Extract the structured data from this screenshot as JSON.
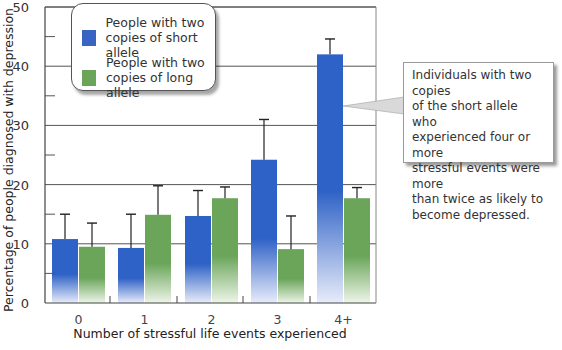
{
  "chart_data": {
    "type": "bar",
    "title": "",
    "xlabel": "Number of stressful life events experienced",
    "ylabel": "Percentage of people diagnosed with depression",
    "ylim": [
      0,
      50
    ],
    "yticks": [
      0,
      10,
      20,
      30,
      40,
      50
    ],
    "grid": true,
    "legend_position": "top-left",
    "categories": [
      "0",
      "1",
      "2",
      "3",
      "4+"
    ],
    "series": [
      {
        "name": "People with two copies of short allele",
        "color": "#2f62c6",
        "values": [
          10.8,
          9.3,
          14.7,
          24.2,
          42
        ],
        "error_upper": [
          15,
          15,
          19,
          31,
          44.6
        ]
      },
      {
        "name": "People with two copies of long allele",
        "color": "#6aa55a",
        "values": [
          9.5,
          14.9,
          17.7,
          9.1,
          17.7
        ],
        "error_upper": [
          13.5,
          19.8,
          19.6,
          14.7,
          19.5
        ]
      }
    ],
    "annotations": [
      "Individuals with two copies of the short allele who experienced four or more stressful events were more than twice as likely to become depressed."
    ]
  },
  "legend": {
    "items": [
      {
        "label": "People with two\ncopies of short allele",
        "color": "#3a64c4"
      },
      {
        "label": "People with two\ncopies of long allele",
        "color": "#6aa55a"
      }
    ]
  },
  "callout": {
    "text": "Individuals with two copies\nof the short allele who\nexperienced four or more\nstressful events were more\nthan twice as likely to\nbecome depressed."
  }
}
